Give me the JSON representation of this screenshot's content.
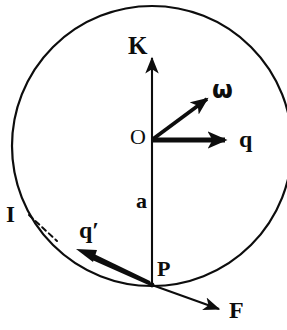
{
  "figure": {
    "background_color": "#ffffff",
    "ink_color": "#0d0d0d",
    "circle": {
      "name": "sphere-outline",
      "center_x": 152,
      "center_y": 146,
      "radius": 140,
      "stroke_width": 2,
      "filled": false
    },
    "labels": {
      "k_axis": "K",
      "omega": "ω",
      "origin": "O",
      "q_vector": "q",
      "radius_a": "a",
      "incident_I": "I",
      "q_prime": "q′",
      "point_p": "P",
      "force_f": "F"
    },
    "vectors": [
      {
        "name": "k-axis-arrow",
        "label": "K",
        "from_x": 152,
        "from_y": 285,
        "to_x": 152,
        "to_y": 55,
        "style": "thin",
        "stroke_width": 2
      },
      {
        "name": "omega-arrow",
        "label": "ω",
        "from_x": 152,
        "from_y": 140,
        "to_x": 211,
        "to_y": 95,
        "style": "medium",
        "stroke_width": 4
      },
      {
        "name": "q-arrow",
        "label": "q",
        "from_x": 152,
        "from_y": 140,
        "to_x": 233,
        "to_y": 140,
        "style": "thick",
        "stroke_width": 5
      },
      {
        "name": "q-prime-arrow",
        "label": "q′",
        "from_x": 152,
        "from_y": 285,
        "to_x": 82,
        "to_y": 252,
        "style": "tapered-thick",
        "stroke_width": 6
      },
      {
        "name": "force-f-arrow",
        "label": "F",
        "from_x": 152,
        "from_y": 285,
        "to_x": 226,
        "to_y": 311,
        "style": "thin",
        "stroke_width": 2
      }
    ],
    "leader_lines": [
      {
        "name": "incident-i-leader",
        "label": "I",
        "from_x": 28,
        "from_y": 214,
        "to_x": 56,
        "to_y": 240,
        "dashed": true,
        "stroke_width": 2
      }
    ],
    "points": [
      {
        "name": "origin-point",
        "label": "O",
        "x": 152,
        "y": 140
      },
      {
        "name": "surface-point-p",
        "label": "P",
        "x": 152,
        "y": 285
      }
    ],
    "segments": [
      {
        "name": "radius-segment-a",
        "label": "a",
        "from_x": 152,
        "from_y": 140,
        "to_x": 152,
        "to_y": 285
      }
    ]
  }
}
